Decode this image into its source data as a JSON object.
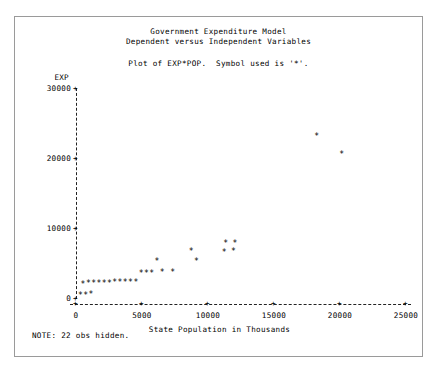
{
  "window": {
    "title_line1": "Government Expenditure Model",
    "title_line2": "Dependent versus Independent Variables",
    "plot_of_line": "Plot of EXP*POP.  Symbol used is '*'.",
    "note": "NOTE: 22 obs hidden.",
    "symbol": "*"
  },
  "chart_data": {
    "type": "scatter",
    "title": "Government Expenditure Model\nDependent versus Independent Variables",
    "subtitle": "Plot of EXP*POP.  Symbol used is '*'.",
    "xlabel": "State Population in Thousands",
    "ylabel": "EXP",
    "xlim": [
      0,
      26500
    ],
    "ylim": [
      0,
      31500
    ],
    "xticks": [
      0,
      5000,
      10000,
      15000,
      20000,
      25000
    ],
    "xticklabels": [
      "0",
      "5000",
      "10000",
      "15000",
      "20000",
      "25000"
    ],
    "yticks": [
      0,
      10000,
      20000,
      30000
    ],
    "yticklabels": [
      "0",
      "10000",
      "20000",
      "30000"
    ],
    "grid": false,
    "legend": false,
    "marker": "*",
    "note": "NOTE: 22 obs hidden.",
    "points": [
      {
        "x": 300,
        "y": 300
      },
      {
        "x": 700,
        "y": 350
      },
      {
        "x": 1100,
        "y": 400
      },
      {
        "x": 500,
        "y": 1900
      },
      {
        "x": 900,
        "y": 1950
      },
      {
        "x": 1300,
        "y": 2000
      },
      {
        "x": 1700,
        "y": 2000
      },
      {
        "x": 2100,
        "y": 2050
      },
      {
        "x": 2500,
        "y": 2050
      },
      {
        "x": 2900,
        "y": 2100
      },
      {
        "x": 3300,
        "y": 2100
      },
      {
        "x": 3700,
        "y": 2150
      },
      {
        "x": 4100,
        "y": 2150
      },
      {
        "x": 4500,
        "y": 2200
      },
      {
        "x": 4900,
        "y": 3400
      },
      {
        "x": 5300,
        "y": 3450
      },
      {
        "x": 5700,
        "y": 3500
      },
      {
        "x": 6500,
        "y": 3550
      },
      {
        "x": 7300,
        "y": 3600
      },
      {
        "x": 6100,
        "y": 5100
      },
      {
        "x": 9100,
        "y": 5200
      },
      {
        "x": 8700,
        "y": 6600
      },
      {
        "x": 11200,
        "y": 6500
      },
      {
        "x": 11900,
        "y": 6550
      },
      {
        "x": 11300,
        "y": 7700
      },
      {
        "x": 12000,
        "y": 7750
      },
      {
        "x": 18200,
        "y": 23000
      },
      {
        "x": 20100,
        "y": 20500
      }
    ],
    "hidden_obs": 22
  },
  "axis": {
    "y_tick_glyph": "+",
    "x_tick_glyph": "+"
  }
}
